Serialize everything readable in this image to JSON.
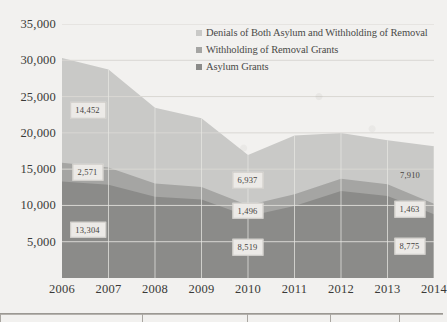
{
  "chart_data": {
    "type": "area",
    "stacked": true,
    "title": "",
    "xlabel": "",
    "ylabel": "",
    "x": [
      2006,
      2007,
      2008,
      2009,
      2010,
      2011,
      2012,
      2013,
      2014
    ],
    "categories": [
      "2006",
      "2007",
      "2008",
      "2009",
      "2010",
      "2011",
      "2012",
      "2013",
      "2014"
    ],
    "ylim": [
      0,
      35000
    ],
    "yticks": [
      5000,
      10000,
      15000,
      20000,
      25000,
      30000,
      35000
    ],
    "ytick_labels": [
      "5,000",
      "10,000",
      "15,000",
      "20,000",
      "25,000",
      "30,000",
      "35,000"
    ],
    "grid": "horizontal",
    "legend_position": "top-center",
    "series": [
      {
        "name": "Asylum Grants",
        "color": "#8b8b89",
        "values": [
          13304,
          12841,
          11180,
          10805,
          8519,
          9908,
          11978,
          11300,
          8775
        ]
      },
      {
        "name": "Withholding of Removal Grants",
        "color": "#a5a5a3",
        "values": [
          2571,
          2400,
          1845,
          1740,
          1496,
          1620,
          1700,
          1610,
          1463
        ]
      },
      {
        "name": "Denials of Both Asylum and Withholding of Removal",
        "color": "#c9c9c7",
        "values": [
          14452,
          13500,
          10420,
          9480,
          6937,
          8120,
          6300,
          6060,
          7910
        ]
      }
    ],
    "data_labels": [
      {
        "text": "14,452",
        "x": 2006,
        "series": "Denials of Both Asylum and Withholding of Removal",
        "value": 14452
      },
      {
        "text": "2,571",
        "x": 2006,
        "series": "Withholding of Removal Grants",
        "value": 2571
      },
      {
        "text": "13,304",
        "x": 2006,
        "series": "Asylum Grants",
        "value": 13304
      },
      {
        "text": "6,937",
        "x": 2010,
        "series": "Denials of Both Asylum and Withholding of Removal",
        "value": 6937
      },
      {
        "text": "1,496",
        "x": 2010,
        "series": "Withholding of Removal Grants",
        "value": 1496
      },
      {
        "text": "8,519",
        "x": 2010,
        "series": "Asylum Grants",
        "value": 8519
      },
      {
        "text": "7,910",
        "x": 2014,
        "series": "Denials of Both Asylum and Withholding of Removal",
        "value": 7910
      },
      {
        "text": "1,463",
        "x": 2014,
        "series": "Withholding of Removal Grants",
        "value": 1463
      },
      {
        "text": "8,775",
        "x": 2014,
        "series": "Asylum Grants",
        "value": 8775
      }
    ],
    "totals": [
      30327,
      28741,
      23445,
      22025,
      16952,
      19648,
      19978,
      18970,
      18148
    ]
  },
  "legend": {
    "items": [
      {
        "label": "Denials of Both Asylum and Withholding of Removal",
        "color": "#c9c9c7"
      },
      {
        "label": "Withholding of Removal Grants",
        "color": "#a5a5a3"
      },
      {
        "label": "Asylum Grants",
        "color": "#8b8b89"
      }
    ]
  },
  "colors": {
    "background": "#f2f1ef",
    "gridline": "#d9d7d3",
    "axis_text": "#3a3a38",
    "label_bg": "#eceae7",
    "label_border": "#cfcdc9"
  }
}
